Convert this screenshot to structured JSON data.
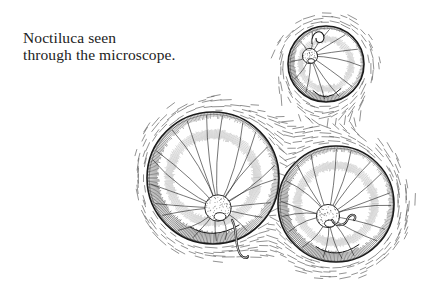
{
  "caption": {
    "line1": "Noctiluca seen",
    "line2": "through the microscope."
  },
  "illustration": {
    "subject": "Noctiluca cells under microscope",
    "ink_color": "#1a1a1a",
    "dash_color": "#555555",
    "cells": [
      {
        "name": "top-cell",
        "cx": 326,
        "cy": 64,
        "r": 38,
        "nucleus": [
          310,
          56
        ],
        "tentacle": false
      },
      {
        "name": "left-cell",
        "cx": 213,
        "cy": 178,
        "r": 66,
        "nucleus": [
          218,
          208
        ],
        "tentacle": true
      },
      {
        "name": "right-cell",
        "cx": 336,
        "cy": 204,
        "r": 58,
        "nucleus": [
          328,
          216
        ],
        "tentacle": true
      }
    ]
  }
}
